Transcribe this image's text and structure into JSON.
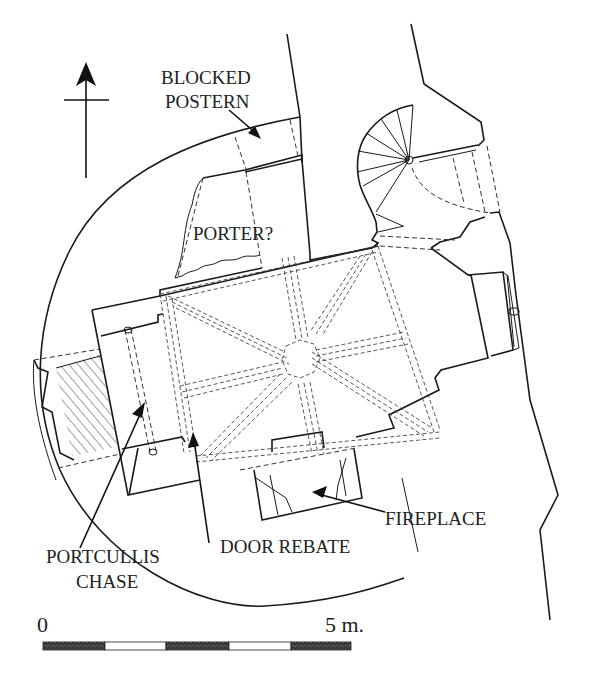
{
  "diagram": {
    "type": "architectural-floor-plan",
    "north_arrow": {
      "direction": "up"
    },
    "labels": {
      "blocked_postern_line1": "BLOCKED",
      "blocked_postern_line2": "POSTERN",
      "porter": "PORTER?",
      "fireplace": "FIREPLACE",
      "door_rebate": "DOOR REBATE",
      "portcullis_line1": "PORTCULLIS",
      "portcullis_line2": "CHASE"
    },
    "scale_bar": {
      "start_label": "0",
      "end_label": "5 m.",
      "segments": 5,
      "segment_pattern": [
        "filled",
        "empty",
        "filled",
        "empty",
        "filled"
      ]
    },
    "colors": {
      "line": "#1a1a1a",
      "background": "#ffffff",
      "scale_fill": "#3a3a3a"
    }
  }
}
